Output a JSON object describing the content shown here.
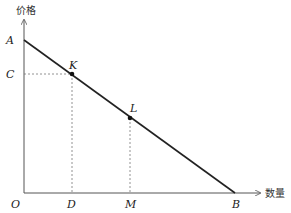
{
  "diagram": {
    "type": "linear-demand-curve",
    "y_axis_label": "价格",
    "x_axis_label": "数量",
    "origin_label": "O",
    "curve": {
      "from": "A",
      "to": "B"
    },
    "points": {
      "A": {
        "label": "A",
        "on": "y-axis"
      },
      "B": {
        "label": "B",
        "on": "x-axis"
      },
      "C": {
        "label": "C",
        "on": "y-axis"
      },
      "D": {
        "label": "D",
        "on": "x-axis"
      },
      "M": {
        "label": "M",
        "on": "x-axis"
      },
      "K": {
        "label": "K",
        "on": "curve",
        "projects_to": [
          "C",
          "D"
        ]
      },
      "L": {
        "label": "L",
        "on": "curve",
        "projects_to": [
          "M"
        ]
      }
    },
    "colors": {
      "curve": "#222222",
      "axis": "#555555",
      "guide": "#777777"
    }
  }
}
